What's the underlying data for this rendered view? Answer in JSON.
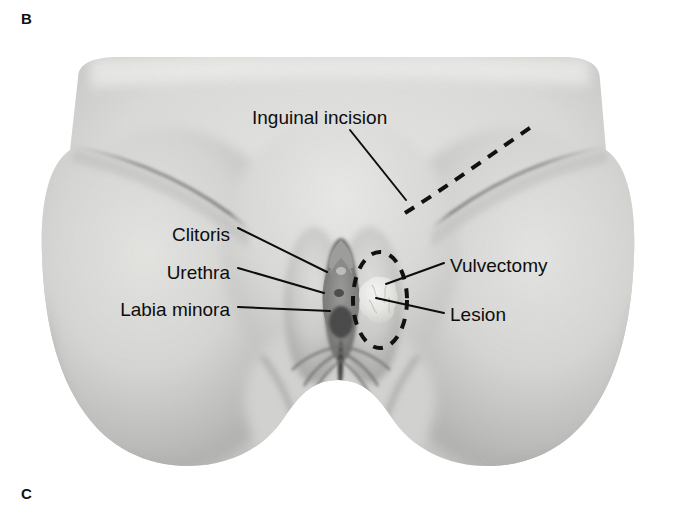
{
  "figure": {
    "panel_letter_top": "B",
    "panel_letter_bottom": "C",
    "style": "grayscale medical illustration",
    "background_color": "#ffffff",
    "ink_color": "#0d0d0d",
    "canvas": {
      "width": 676,
      "height": 514
    }
  },
  "annotations": {
    "inguinal_incision": {
      "label": "Inguinal incision",
      "x": 252,
      "y": 117,
      "align": "left"
    },
    "clitoris": {
      "label": "Clitoris",
      "x": 230,
      "y": 234,
      "align": "right"
    },
    "urethra": {
      "label": "Urethra",
      "x": 230,
      "y": 272,
      "align": "right"
    },
    "labia_minora": {
      "label": "Labia minora",
      "x": 230,
      "y": 309,
      "align": "right"
    },
    "vulvectomy": {
      "label": "Vulvectomy",
      "x": 450,
      "y": 265,
      "align": "left"
    },
    "lesion": {
      "label": "Lesion",
      "x": 450,
      "y": 314,
      "align": "left"
    }
  },
  "markings": {
    "inguinal_incision_line": {
      "name": "dashed inguinal incision line",
      "style": "dashed",
      "color": "#111111",
      "from": [
        405,
        213
      ],
      "to": [
        537,
        123
      ]
    },
    "vulvectomy_outline": {
      "name": "dashed vulvectomy resection ellipse",
      "style": "dashed",
      "color": "#111111",
      "center": [
        380,
        300
      ],
      "rx": 27,
      "ry": 48
    },
    "lesion_mass": {
      "name": "pale raised lesion",
      "color": "#e9e9e7",
      "center": [
        381,
        300
      ],
      "rx": 15,
      "ry": 23
    }
  },
  "leader_lines": [
    {
      "name": "inguinal-incision-leader",
      "from": [
        350,
        130
      ],
      "to": [
        406,
        200
      ]
    },
    {
      "name": "clitoris-leader",
      "from": [
        238,
        228
      ],
      "to": [
        327,
        272
      ]
    },
    {
      "name": "urethra-leader",
      "from": [
        238,
        268
      ],
      "to": [
        324,
        293
      ]
    },
    {
      "name": "labia-minora-leader",
      "from": [
        238,
        307
      ],
      "to": [
        330,
        311
      ]
    },
    {
      "name": "vulvectomy-leader",
      "from": [
        444,
        263
      ],
      "to": [
        386,
        284
      ]
    },
    {
      "name": "lesion-leader",
      "from": [
        444,
        313
      ],
      "to": [
        376,
        298
      ]
    }
  ],
  "palette": {
    "skin_light": "#e2e2e0",
    "skin_mid": "#c9c9c7",
    "skin_shade": "#ababa9",
    "skin_deep": "#8e8e8c",
    "crease": "#6d6d6b",
    "dark_fold": "#3c3c3a"
  }
}
